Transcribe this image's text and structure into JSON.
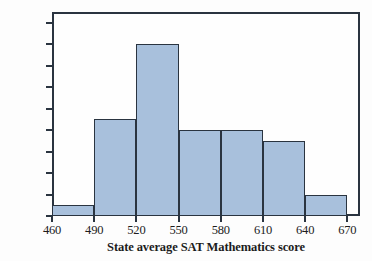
{
  "chart_data": {
    "type": "bar",
    "title": "",
    "xlabel": "State average SAT Mathematics score",
    "ylabel": "Number of states",
    "categories": [
      "460-490",
      "490-520",
      "520-550",
      "550-580",
      "580-610",
      "610-640",
      "640-670"
    ],
    "bin_edges": [
      460,
      490,
      520,
      550,
      580,
      610,
      640,
      670
    ],
    "values": [
      1,
      9,
      16,
      8,
      8,
      7,
      2
    ],
    "xlim": [
      460,
      679
    ],
    "ylim": [
      0,
      19
    ],
    "xticks": [
      460,
      490,
      520,
      550,
      580,
      610,
      640,
      670
    ],
    "yticks": [
      0,
      2,
      4,
      6,
      8,
      10,
      12,
      14,
      16,
      18
    ],
    "xtick_labels": [
      "460",
      "490",
      "520",
      "550",
      "580",
      "610",
      "640",
      "670"
    ],
    "ytick_labels": [
      "0",
      "2",
      "4",
      "6",
      "8",
      "10",
      "12",
      "14",
      "16",
      "18"
    ],
    "grid": false,
    "legend": false,
    "bar_fill_color": "#a8c0dc",
    "bar_edge_color": "#2a3440",
    "axis_color": "#2a3440",
    "background_color": "#fdfdfd"
  }
}
